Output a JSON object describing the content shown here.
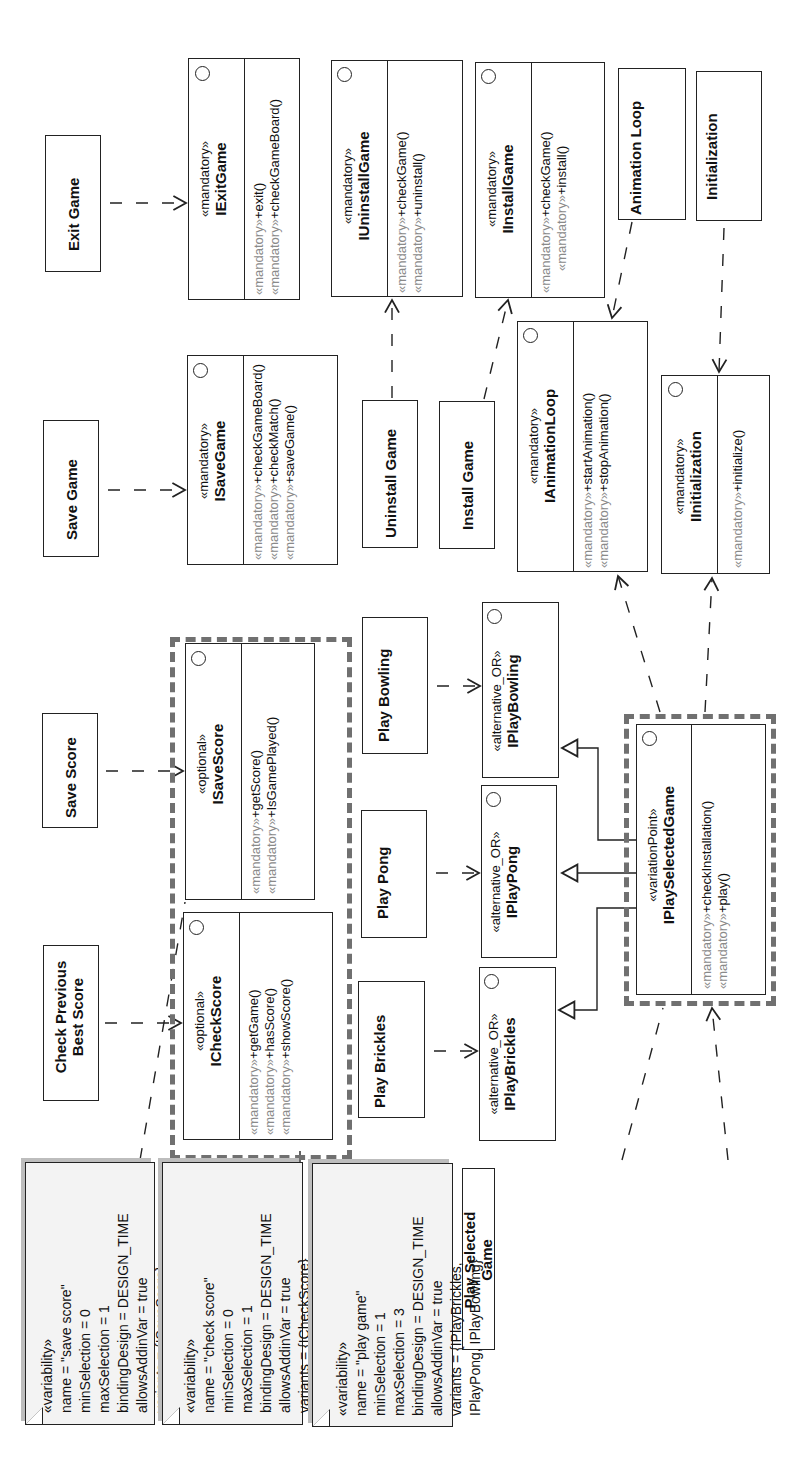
{
  "features": {
    "exit_game": "Exit Game",
    "save_game": "Save Game",
    "save_score": "Save Score",
    "check_previous_best_score": [
      "Check Previous",
      "Best Score"
    ],
    "uninstall_game": "Uninstall Game",
    "install_game": "Install Game",
    "animation_loop": "Animation Loop",
    "initialization": "Initialization",
    "play_bowling": "Play Bowling",
    "play_pong": "Play Pong",
    "play_brickles": "Play Brickles",
    "play_selected_game": [
      "Play Selected",
      "Game"
    ]
  },
  "interfaces": {
    "iexitgame": {
      "stereotype": "«mandatory»",
      "name": "IExitGame",
      "ops": [
        {
          "st": "«mandatory»",
          "op": "+exit()"
        },
        {
          "st": "«mandatory»",
          "op": "+checkGameBoard()"
        }
      ]
    },
    "isavegame": {
      "stereotype": "«mandatory»",
      "name": "ISaveGame",
      "ops": [
        {
          "st": "«mandatory»",
          "op": "+checkGameBoard()"
        },
        {
          "st": "«mandatory»",
          "op": "+checkMatch()"
        },
        {
          "st": "«mandatory»",
          "op": "+saveGame()"
        }
      ]
    },
    "iuninstallgame": {
      "stereotype": "«mandatory»",
      "name": "IUninstallGame",
      "ops": [
        {
          "st": "«mandatory»",
          "op": "+checkGame()"
        },
        {
          "st": "«mandatory»",
          "op": "+uninstall()"
        }
      ]
    },
    "iinstallgame": {
      "stereotype": "«mandatory»",
      "name": "IInstallGame",
      "ops": [
        {
          "st": "«mandatory»",
          "op": "+checkGame()"
        },
        {
          "st": "«mandatory»",
          "op": "+install()"
        }
      ]
    },
    "ianimationloop": {
      "stereotype": "«mandatory»",
      "name": "IAnimationLoop",
      "ops": [
        {
          "st": "«mandatory»",
          "op": "+startAnimation()"
        },
        {
          "st": "«mandatory»",
          "op": "+stopAnimation()"
        }
      ]
    },
    "iinitialization": {
      "stereotype": "«mandatory»",
      "name": "IInitialization",
      "ops": [
        {
          "st": "«mandatory»",
          "op": "+initialize()"
        }
      ]
    },
    "isavescore": {
      "stereotype": "«optional»",
      "name": "ISaveScore",
      "ops": [
        {
          "st": "«mandatory»",
          "op": "+getScore()"
        },
        {
          "st": "«mandatory»",
          "op": "+IsGamePlayed()"
        }
      ]
    },
    "icheckscore": {
      "stereotype": "«optional»",
      "name": "ICheckScore",
      "ops": [
        {
          "st": "«mandatory»",
          "op": "+getGame()"
        },
        {
          "st": "«mandatory»",
          "op": "+hasScore()"
        },
        {
          "st": "«mandatory»",
          "op": "+showScore()"
        }
      ]
    },
    "iplaybowling": {
      "stereotype": "«alternative_OR»",
      "name": "IPlayBowling"
    },
    "iplaypong": {
      "stereotype": "«alternative_OR»",
      "name": "IPlayPong"
    },
    "iplaybrickles": {
      "stereotype": "«alternative_OR»",
      "name": "IPlayBrickles"
    },
    "iplayselectedgame": {
      "stereotype": "«variationPoint»",
      "name": "IPlaySelectedGame",
      "ops": [
        {
          "st": "«mandatory»",
          "op": "+checkInstallation()"
        },
        {
          "st": "«mandatory»",
          "op": "+play()"
        }
      ]
    }
  },
  "notes": [
    {
      "lines": [
        "«variability»",
        "name = \"save score\"",
        "minSelection = 0",
        "maxSelection = 1",
        "bindingDesign = DESIGN_TIME",
        "allowsAddinVar = true",
        "variants = {ISaveScore}"
      ]
    },
    {
      "lines": [
        "«variability»",
        "name = \"check score\"",
        "minSelection = 0",
        "maxSelection = 1",
        "bindingDesign = DESIGN_TIME",
        "allowsAddinVar = true",
        "variants = {ICheckScore}"
      ]
    },
    {
      "lines": [
        "«variability»",
        "name = \"play game\"",
        "minSelection = 1",
        "maxSelection = 3",
        "bindingDesign = DESIGN_TIME",
        "allowsAddinVar = true",
        "variants = {IPlayBrickles,",
        "IPlayPong, IPlayBowling}"
      ]
    }
  ],
  "colors": {
    "line": "#222222",
    "stereotype_gray": "#8a8a8a",
    "dashed_border": "#707070",
    "note_fill": "#f3f3f3",
    "note_shadow": "#bdbdbd"
  }
}
